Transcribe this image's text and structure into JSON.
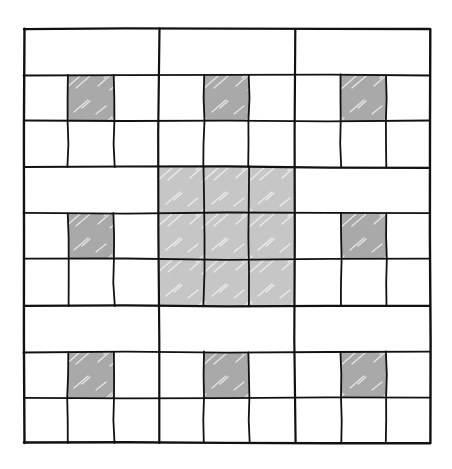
{
  "diagram": {
    "type": "grid-pattern",
    "grid": {
      "left": 24,
      "top": 29,
      "right": 430,
      "bottom": 443,
      "columns": 9,
      "rows": 9,
      "col_edges": [
        24,
        68,
        114,
        159,
        204,
        249,
        295,
        341,
        386,
        430
      ],
      "row_edges": [
        29,
        75,
        121,
        167,
        213,
        259,
        306,
        352,
        398,
        443
      ]
    },
    "blocks": [
      {
        "row": 0,
        "col": 0,
        "kind": "outer",
        "shaded_cell": [
          1,
          1
        ]
      },
      {
        "row": 0,
        "col": 1,
        "kind": "outer",
        "shaded_cell": [
          1,
          1
        ]
      },
      {
        "row": 0,
        "col": 2,
        "kind": "outer",
        "shaded_cell": [
          1,
          1
        ]
      },
      {
        "row": 1,
        "col": 0,
        "kind": "outer",
        "shaded_cell": [
          1,
          1
        ]
      },
      {
        "row": 1,
        "col": 1,
        "kind": "center",
        "shaded_cell": null
      },
      {
        "row": 1,
        "col": 2,
        "kind": "outer",
        "shaded_cell": [
          1,
          1
        ]
      },
      {
        "row": 2,
        "col": 0,
        "kind": "outer",
        "shaded_cell": [
          1,
          1
        ]
      },
      {
        "row": 2,
        "col": 1,
        "kind": "outer",
        "shaded_cell": [
          1,
          1
        ]
      },
      {
        "row": 2,
        "col": 2,
        "kind": "outer",
        "shaded_cell": [
          1,
          1
        ]
      }
    ],
    "colors": {
      "background": "#ffffff",
      "line": "#111111",
      "dark_shade": "#a9a9a9",
      "light_shade": "#c6c6c6",
      "streak": "#f2f2f2"
    },
    "line_widths": {
      "outer": 2.4,
      "block": 2.2,
      "inner": 1.8
    }
  }
}
